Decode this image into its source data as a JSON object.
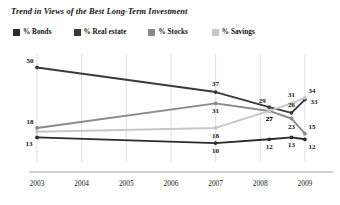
{
  "header": {
    "title": "Trend in Views of the Best Long-Term Investment"
  },
  "legend": {
    "position": "top-left",
    "items": [
      {
        "label": "% Bonds",
        "color": "#2b2b2b"
      },
      {
        "label": "% Real estate",
        "color": "#3a3a3a"
      },
      {
        "label": "% Stocks",
        "color": "#8a8a8a"
      },
      {
        "label": "% Savings",
        "color": "#c6c6c6"
      }
    ]
  },
  "axis": {
    "x_ticks": [
      "2003",
      "2004",
      "2005",
      "2006",
      "2007",
      "2008",
      "2009"
    ],
    "y_visible": false,
    "grid": "vertical"
  },
  "chart_data": {
    "type": "line",
    "title": "Trend in Views of the Best Long-Term Investment",
    "xlabel": "",
    "ylabel": "",
    "ylim": [
      0,
      55
    ],
    "xlim": [
      2003,
      2009.45
    ],
    "grid": "vertical-only",
    "legend_position": "top-left",
    "x_ticks": [
      "2003",
      "2004",
      "2005",
      "2006",
      "2007",
      "2008",
      "2009"
    ],
    "series": [
      {
        "name": "% Real estate",
        "color": "#3a3a3a",
        "points": [
          {
            "x": 2003,
            "y": 50,
            "label": "50",
            "label_pos": "above-left"
          },
          {
            "x": 2007,
            "y": 37,
            "label": "37",
            "label_pos": "above"
          },
          {
            "x": 2008.2,
            "y": 29,
            "label": "29",
            "label_pos": "above-left"
          },
          {
            "x": 2008.7,
            "y": 26,
            "label": "26",
            "label_pos": "above"
          },
          {
            "x": 2009,
            "y": 33,
            "label": "33",
            "label_pos": "right"
          }
        ]
      },
      {
        "name": "% Stocks",
        "color": "#8a8a8a",
        "points": [
          {
            "x": 2003,
            "y": 18,
            "label": "18",
            "label_pos": "above-left"
          },
          {
            "x": 2007,
            "y": 31,
            "label": "31",
            "label_pos": "below"
          },
          {
            "x": 2008.2,
            "y": 27,
            "label": "27",
            "label_pos": "below"
          },
          {
            "x": 2008.7,
            "y": 23,
            "label": "23",
            "label_pos": "below"
          },
          {
            "x": 2009,
            "y": 15,
            "label": "15",
            "label_pos": "above-right"
          }
        ]
      },
      {
        "name": "% Savings",
        "color": "#c6c6c6",
        "points": [
          {
            "x": 2003,
            "y": 16,
            "label": "",
            "label_pos": "none"
          },
          {
            "x": 2007,
            "y": 18,
            "label": "18",
            "label_pos": "below"
          },
          {
            "x": 2008.2,
            "y": 27,
            "label": "27",
            "label_pos": "below"
          },
          {
            "x": 2008.7,
            "y": 31,
            "label": "31",
            "label_pos": "above"
          },
          {
            "x": 2009,
            "y": 34,
            "label": "34",
            "label_pos": "above-right"
          }
        ]
      },
      {
        "name": "% Bonds",
        "color": "#2b2b2b",
        "points": [
          {
            "x": 2003,
            "y": 13,
            "label": "13",
            "label_pos": "below-left"
          },
          {
            "x": 2007,
            "y": 10,
            "label": "10",
            "label_pos": "below"
          },
          {
            "x": 2008.2,
            "y": 12,
            "label": "12",
            "label_pos": "below"
          },
          {
            "x": 2008.7,
            "y": 13,
            "label": "13",
            "label_pos": "below"
          },
          {
            "x": 2009,
            "y": 12,
            "label": "12",
            "label_pos": "below-right"
          }
        ]
      }
    ]
  }
}
